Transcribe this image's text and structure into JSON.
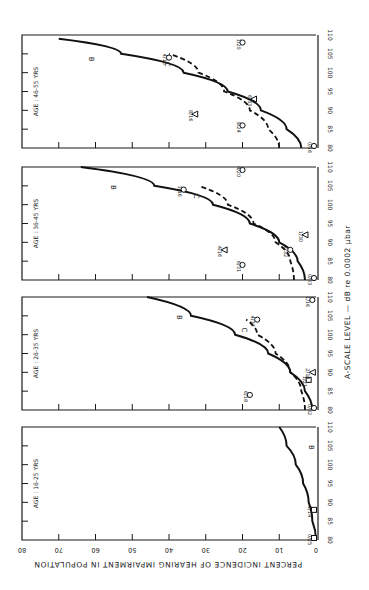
{
  "chart_data": [
    {
      "type": "line",
      "panel_label": "AGE : 46-55 YRS",
      "xlabel": "A-SCALE LEVEL — dB re 0.0002 µbar",
      "ylabel": "PERCENT INCIDENCE OF HEARING IMPAIRMENT IN POPULATION",
      "xlim": [
        80,
        110
      ],
      "ylim": [
        0,
        80
      ],
      "x_ticks": [
        "80",
        "85",
        "90",
        "95",
        "100",
        "105",
        "110"
      ],
      "series": [
        {
          "name": "B",
          "style": "solid",
          "x": [
            80,
            85,
            90,
            95,
            100,
            105,
            109
          ],
          "y": [
            4,
            8,
            15,
            24,
            36,
            53,
            70
          ]
        },
        {
          "name": "C",
          "style": "dashed",
          "x": [
            80,
            85,
            90,
            95,
            100,
            105
          ],
          "y": [
            10,
            13,
            18,
            25,
            32,
            40
          ]
        }
      ],
      "points": [
        {
          "marker": "circle",
          "label": "0/16",
          "x": 80,
          "y": 0
        },
        {
          "marker": "circle",
          "label": "9/24",
          "x": 86,
          "y": 20
        },
        {
          "marker": "triangle",
          "label": "8/16",
          "x": 89,
          "y": 33
        },
        {
          "marker": "triangle",
          "label": "6/33",
          "x": 93,
          "y": 17
        },
        {
          "marker": "circle",
          "label": "4/16",
          "x": 104,
          "y": 40
        },
        {
          "marker": "circle",
          "label": "1/20",
          "x": 108,
          "y": 20
        }
      ]
    },
    {
      "type": "line",
      "panel_label": "AGE : 36-45 YRS",
      "xlim": [
        80,
        110
      ],
      "ylim": [
        0,
        80
      ],
      "x_ticks": [
        "80",
        "85",
        "90",
        "95",
        "100",
        "105",
        "110"
      ],
      "series": [
        {
          "name": "B",
          "style": "solid",
          "x": [
            80,
            85,
            90,
            95,
            100,
            105,
            110
          ],
          "y": [
            3,
            5,
            10,
            18,
            28,
            44,
            64
          ]
        },
        {
          "name": "C",
          "style": "dashed",
          "x": [
            80,
            85,
            90,
            95,
            100,
            105
          ],
          "y": [
            6,
            7,
            11,
            17,
            24,
            32
          ]
        }
      ],
      "points": [
        {
          "marker": "circle",
          "label": "0/33",
          "x": 80,
          "y": 0
        },
        {
          "marker": "circle",
          "label": "6/31",
          "x": 84,
          "y": 20
        },
        {
          "marker": "triangle",
          "label": "4/16",
          "x": 88,
          "y": 25
        },
        {
          "marker": "circle",
          "label": "2/32",
          "x": 88,
          "y": 7
        },
        {
          "marker": "triangle",
          "label": "1/30",
          "x": 92,
          "y": 3
        },
        {
          "marker": "circle",
          "label": "3/16",
          "x": 104,
          "y": 36
        },
        {
          "marker": "circle",
          "label": "4/20",
          "x": 110,
          "y": 20
        }
      ]
    },
    {
      "type": "line",
      "panel_label": "AGE : 26-35 YRS",
      "xlim": [
        80,
        110
      ],
      "ylim": [
        0,
        80
      ],
      "x_ticks": [
        "80",
        "85",
        "90",
        "95",
        "100",
        "105",
        "110"
      ],
      "series": [
        {
          "name": "B",
          "style": "solid",
          "x": [
            80,
            85,
            90,
            95,
            100,
            105,
            110
          ],
          "y": [
            1,
            3,
            7,
            13,
            22,
            34,
            46
          ]
        },
        {
          "name": "C",
          "style": "dashed",
          "x": [
            80,
            85,
            90,
            95,
            100,
            104
          ],
          "y": [
            3,
            4,
            7,
            11,
            16,
            19
          ]
        }
      ],
      "points": [
        {
          "marker": "circle",
          "label": "0/32",
          "x": 80,
          "y": 0
        },
        {
          "marker": "circle",
          "label": "6/18",
          "x": 84,
          "y": 18
        },
        {
          "marker": "square",
          "label": "1/21",
          "x": 88,
          "y": 2
        },
        {
          "marker": "triangle",
          "label": "2/18",
          "x": 90,
          "y": 1
        },
        {
          "marker": "circle",
          "label": "4/32",
          "x": 104,
          "y": 16
        },
        {
          "marker": "circle",
          "label": "1/16",
          "x": 110,
          "y": 1
        }
      ]
    },
    {
      "type": "line",
      "panel_label": "AGE : 16-25 YRS",
      "xlim": [
        80,
        110
      ],
      "ylim": [
        0,
        80
      ],
      "x_ticks": [
        "80",
        "85",
        "90",
        "95",
        "100",
        "105",
        "110"
      ],
      "y_ticks": [
        "0",
        "10",
        "20",
        "30",
        "40",
        "50",
        "60",
        "70",
        "80"
      ],
      "series": [
        {
          "name": "B",
          "style": "solid",
          "x": [
            80,
            85,
            90,
            95,
            100,
            105,
            110
          ],
          "y": [
            0,
            1,
            2,
            3.5,
            5.5,
            8,
            10
          ]
        }
      ],
      "points": [
        {
          "marker": "square",
          "label": "0/25",
          "x": 80,
          "y": 0
        },
        {
          "marker": "square",
          "label": "1/14",
          "x": 88,
          "y": 0.5
        }
      ]
    }
  ],
  "figure": {
    "xlabel": "A-SCALE LEVEL — dB re 0.0002 µbar",
    "ylabel": "PERCENT INCIDENCE OF HEARING IMPAIRMENT IN POPULATION",
    "percent_ticks": [
      "0",
      "10",
      "20",
      "30",
      "40",
      "50",
      "60",
      "70",
      "80"
    ],
    "db_ticks": [
      "80",
      "85",
      "90",
      "95",
      "100",
      "105",
      "110"
    ],
    "panels": [
      {
        "label": "AGE : 46-55 YRS"
      },
      {
        "label": "AGE : 36-45 YRS"
      },
      {
        "label": "AGE : 26-35 YRS"
      },
      {
        "label": "AGE : 16-25 YRS"
      }
    ]
  }
}
